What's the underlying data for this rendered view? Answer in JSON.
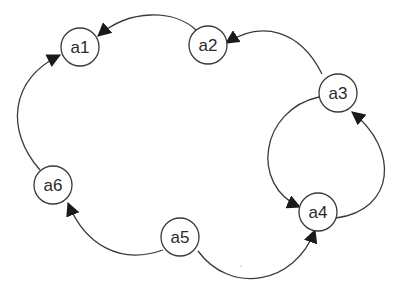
{
  "diagram": {
    "type": "directed-graph",
    "colors": {
      "background": "#ffffff",
      "stroke": "#3a3a3a",
      "arrow": "#1a1a1a",
      "text": "#2a2a2a"
    },
    "nodes": [
      {
        "id": "a1",
        "label": "a1",
        "x": 80,
        "y": 47
      },
      {
        "id": "a2",
        "label": "a2",
        "x": 208,
        "y": 45
      },
      {
        "id": "a3",
        "label": "a3",
        "x": 338,
        "y": 93
      },
      {
        "id": "a4",
        "label": "a4",
        "x": 318,
        "y": 212
      },
      {
        "id": "a5",
        "label": "a5",
        "x": 180,
        "y": 237
      },
      {
        "id": "a6",
        "label": "a6",
        "x": 53,
        "y": 185
      }
    ],
    "edges": [
      {
        "from": "a2",
        "to": "a1"
      },
      {
        "from": "a6",
        "to": "a1"
      },
      {
        "from": "a3",
        "to": "a2"
      },
      {
        "from": "a3",
        "to": "a4"
      },
      {
        "from": "a4",
        "to": "a3"
      },
      {
        "from": "a5",
        "to": "a6"
      },
      {
        "from": "a5",
        "to": "a4"
      }
    ]
  }
}
